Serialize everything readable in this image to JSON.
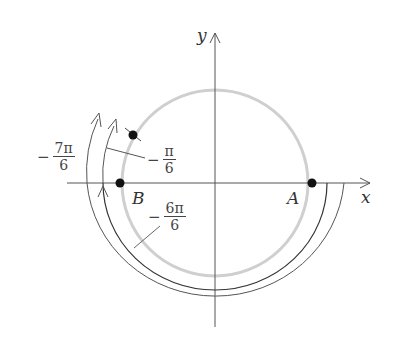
{
  "diagram": {
    "axes": {
      "x_label": "x",
      "y_label": "y"
    },
    "points": [
      {
        "name": "A",
        "label": "A"
      },
      {
        "name": "B",
        "label": "B"
      },
      {
        "name": "P",
        "label": ""
      }
    ],
    "angle_labels": {
      "neg_7pi_6": {
        "sign": "−",
        "num": "7π",
        "den": "6"
      },
      "neg_pi_6": {
        "sign": "−",
        "num": "π",
        "den": "6"
      },
      "neg_6pi_6": {
        "sign": "−",
        "num": "6π",
        "den": "6"
      }
    },
    "colors": {
      "circle": "#cccccc",
      "axis": "#555555",
      "arc": "#333333",
      "point": "#111111"
    }
  }
}
